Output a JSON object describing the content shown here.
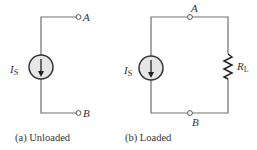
{
  "figure": {
    "panels": [
      {
        "id": "a",
        "caption": "(a) Unloaded",
        "source_label": "I",
        "source_subscript": "S",
        "terminals": [
          {
            "name": "A",
            "label": "A"
          },
          {
            "name": "B",
            "label": "B"
          }
        ]
      },
      {
        "id": "b",
        "caption": "(b) Loaded",
        "source_label": "I",
        "source_subscript": "S",
        "terminals": [
          {
            "name": "A",
            "label": "A"
          },
          {
            "name": "B",
            "label": "B"
          }
        ],
        "load_label": "R",
        "load_subscript": "L"
      }
    ],
    "colors": {
      "wire": "#6e6e6e",
      "source_fill": "#e6e6e6",
      "text": "#333333"
    },
    "icons": {
      "current_source": "current-source-down-arrow-icon",
      "resistor": "resistor-zigzag-icon",
      "terminal": "open-terminal-circle-icon"
    }
  }
}
